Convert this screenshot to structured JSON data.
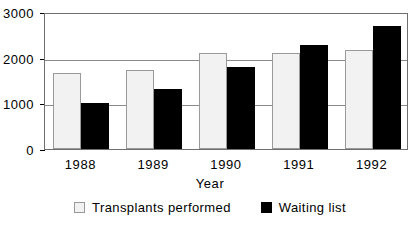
{
  "chart_data": {
    "type": "bar",
    "title": "",
    "subtitle": "",
    "xlabel": "Year",
    "ylabel": "",
    "categories": [
      "1988",
      "1989",
      "1990",
      "1991",
      "1992"
    ],
    "series": [
      {
        "name": "Transplants performed",
        "color": "#f2f2f2",
        "values": [
          1670,
          1720,
          2110,
          2110,
          2170
        ]
      },
      {
        "name": "Waiting list",
        "color": "#000000",
        "values": [
          1010,
          1320,
          1790,
          2270,
          2690
        ]
      }
    ],
    "ylim": [
      0,
      3000
    ],
    "ytick_labels": [
      "0",
      "1000",
      "2000",
      "3000"
    ],
    "ytick_values": [
      0,
      1000,
      2000,
      3000
    ],
    "grid": true,
    "grid_axis": "y",
    "legend_position": "bottom"
  },
  "legend": {
    "entries": [
      {
        "label": "Transplants performed",
        "swatch": "light-square-icon"
      },
      {
        "label": "Waiting list",
        "swatch": "dark-square-icon"
      }
    ]
  }
}
